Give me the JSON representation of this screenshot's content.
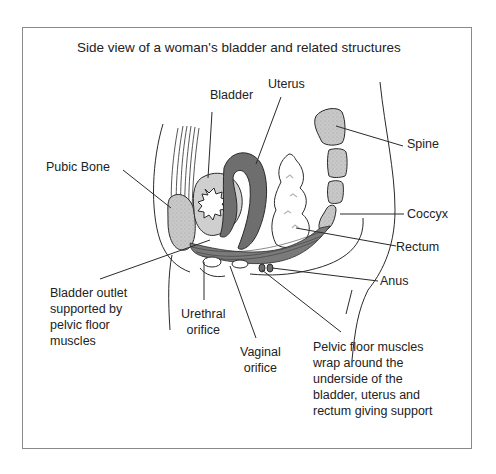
{
  "title": "Side view of a woman's bladder and related structures",
  "labels": {
    "uterus": "Uterus",
    "bladder": "Bladder",
    "pubic_bone": "Pubic Bone",
    "spine": "Spine",
    "coccyx": "Coccyx",
    "rectum": "Rectum",
    "anus": "Anus",
    "bladder_outlet": "Bladder outlet\nsupported by\npelvic floor\nmuscles",
    "urethral_orifice": "Urethral\norifice",
    "vaginal_orifice": "Vaginal\norifice",
    "pelvic_floor": "Pelvic floor muscles\nwrap around the\nunderside of the\nbladder, uterus and\nrectum giving support"
  },
  "colors": {
    "line": "#2a2a2a",
    "bone_fill": "#c8c8c8",
    "uterus_fill": "#6e6e6e",
    "bladder_wall_fill": "#cfcfcf",
    "muscle_fill": "#7a7a7a",
    "frame": "#8a8a8a"
  }
}
